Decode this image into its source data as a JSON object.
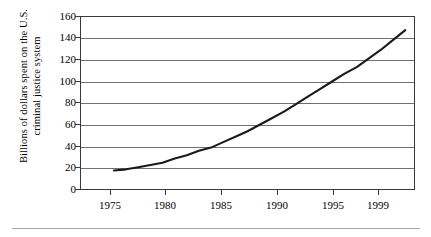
{
  "chart_data": {
    "type": "line",
    "title": "",
    "xlabel": "",
    "ylabel_line1": "Billions of dollars spent on the U.S.",
    "ylabel_line2": "criminal justice system",
    "x": [
      1975,
      1976,
      1977,
      1978,
      1979,
      1980,
      1981,
      1982,
      1983,
      1984,
      1985,
      1986,
      1987,
      1988,
      1989,
      1990,
      1991,
      1992,
      1993,
      1994,
      1995,
      1996,
      1997,
      1998,
      1999
    ],
    "values": [
      18,
      19,
      21,
      23,
      25,
      29,
      32,
      36,
      39,
      44,
      49,
      54,
      60,
      66,
      72,
      79,
      86,
      93,
      100,
      107,
      113,
      121,
      129,
      138,
      147
    ],
    "series": [
      {
        "name": "Criminal justice spending",
        "values": [
          18,
          19,
          21,
          23,
          25,
          29,
          32,
          36,
          39,
          44,
          49,
          54,
          60,
          66,
          72,
          79,
          86,
          93,
          100,
          107,
          113,
          121,
          129,
          138,
          147
        ]
      }
    ],
    "x_ticks": [
      1975,
      1980,
      1985,
      1990,
      1995,
      1999
    ],
    "x_tick_labels": [
      "1975",
      "1980",
      "1985",
      "1990",
      "1995",
      "1999"
    ],
    "y_ticks": [
      0,
      20,
      40,
      60,
      80,
      100,
      120,
      140,
      160
    ],
    "y_tick_labels": [
      "0",
      "20",
      "40",
      "60",
      "80",
      "100",
      "120",
      "140",
      "160"
    ],
    "xlim": [
      1972.2,
      1999.8
    ],
    "ylim": [
      0,
      160
    ],
    "grid": "horizontal",
    "legend": "none",
    "line_color": "#1a1a1a",
    "grid_color": "#707070",
    "frame_color": "#3a3a3a"
  }
}
